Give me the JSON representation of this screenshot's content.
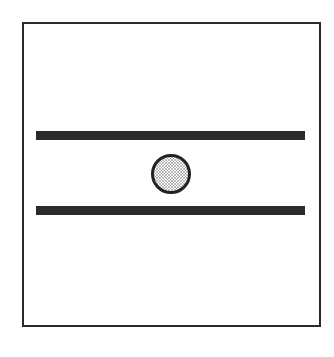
{
  "diagram": {
    "elements": {
      "frame": {
        "shape": "rectangle",
        "stroke": "#2a2a2a",
        "fill": "#ffffff"
      },
      "plates": [
        {
          "position": "top",
          "shape": "bar",
          "fill": "#2b2b2b"
        },
        {
          "position": "bottom",
          "shape": "bar",
          "fill": "#2b2b2b"
        }
      ],
      "particle": {
        "shape": "circle",
        "stroke": "#222222",
        "fill": "stippled-gray",
        "dot_color": "#555555"
      }
    }
  }
}
